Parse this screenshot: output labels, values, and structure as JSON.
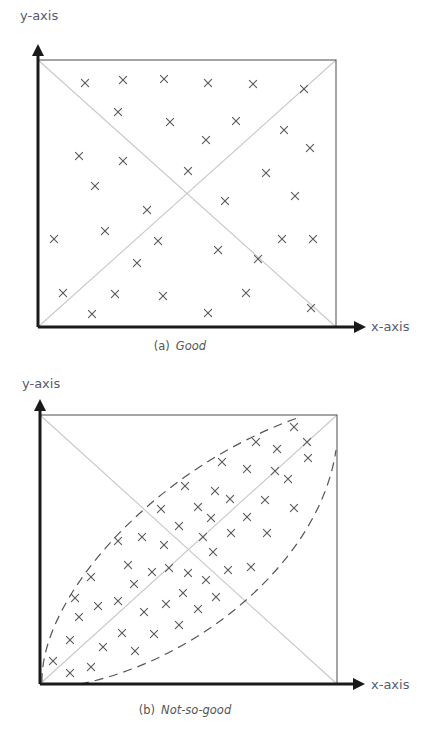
{
  "figures": [
    {
      "id": "a",
      "caption_prefix": "(a)",
      "caption_text": "Good",
      "x_axis_label": "x-axis",
      "y_axis_label": "y-axis",
      "frame": {
        "left": 38,
        "top": 60,
        "right": 336,
        "bottom": 327
      },
      "y_arrow_top": 44,
      "x_arrow_right": 366,
      "y_label_pos": [
        20,
        20
      ],
      "x_label_pos": [
        371,
        331
      ],
      "caption_pos": [
        180,
        350
      ],
      "diagonals": true,
      "ellipse": null,
      "marker": "x",
      "points": [
        [
          85,
          83
        ],
        [
          123,
          80
        ],
        [
          164,
          79
        ],
        [
          208,
          83
        ],
        [
          253,
          84
        ],
        [
          304,
          89
        ],
        [
          118,
          112
        ],
        [
          170,
          122
        ],
        [
          236,
          121
        ],
        [
          284,
          130
        ],
        [
          79,
          156
        ],
        [
          123,
          161
        ],
        [
          206,
          140
        ],
        [
          310,
          148
        ],
        [
          95,
          186
        ],
        [
          188,
          171
        ],
        [
          266,
          173
        ],
        [
          147,
          210
        ],
        [
          225,
          201
        ],
        [
          295,
          196
        ],
        [
          54,
          239
        ],
        [
          105,
          231
        ],
        [
          158,
          241
        ],
        [
          218,
          250
        ],
        [
          282,
          239
        ],
        [
          313,
          239
        ],
        [
          137,
          263
        ],
        [
          258,
          259
        ],
        [
          63,
          293
        ],
        [
          115,
          294
        ],
        [
          163,
          296
        ],
        [
          246,
          293
        ],
        [
          92,
          314
        ],
        [
          208,
          313
        ],
        [
          311,
          308
        ]
      ]
    },
    {
      "id": "b",
      "caption_prefix": "(b)",
      "caption_text": "Not-so-good",
      "x_axis_label": "x-axis",
      "y_axis_label": "y-axis",
      "frame": {
        "left": 40,
        "top": 415,
        "right": 337,
        "bottom": 684
      },
      "y_arrow_top": 399,
      "x_arrow_right": 365,
      "y_label_pos": [
        22,
        388
      ],
      "x_label_pos": [
        371,
        689
      ],
      "caption_pos": [
        185,
        714
      ],
      "diagonals": true,
      "ellipse": {
        "upper_path": "M 42 682 C 40 600, 150 470, 300 417",
        "lower_path": "M 80 684 C 200 660, 320 560, 336 450",
        "dash": "9 6"
      },
      "marker": "x",
      "points": [
        [
          294,
          427
        ],
        [
          256,
          442
        ],
        [
          307,
          442
        ],
        [
          277,
          449
        ],
        [
          308,
          458
        ],
        [
          222,
          462
        ],
        [
          247,
          469
        ],
        [
          275,
          471
        ],
        [
          288,
          479
        ],
        [
          185,
          486
        ],
        [
          215,
          491
        ],
        [
          230,
          499
        ],
        [
          265,
          500
        ],
        [
          161,
          509
        ],
        [
          198,
          507
        ],
        [
          294,
          508
        ],
        [
          211,
          518
        ],
        [
          247,
          517
        ],
        [
          179,
          526
        ],
        [
          203,
          537
        ],
        [
          231,
          533
        ],
        [
          267,
          533
        ],
        [
          118,
          541
        ],
        [
          142,
          537
        ],
        [
          164,
          545
        ],
        [
          213,
          552
        ],
        [
          128,
          565
        ],
        [
          152,
          572
        ],
        [
          169,
          568
        ],
        [
          188,
          573
        ],
        [
          228,
          570
        ],
        [
          251,
          567
        ],
        [
          91,
          577
        ],
        [
          206,
          580
        ],
        [
          134,
          584
        ],
        [
          183,
          593
        ],
        [
          216,
          597
        ],
        [
          75,
          598
        ],
        [
          98,
          606
        ],
        [
          118,
          601
        ],
        [
          166,
          604
        ],
        [
          144,
          612
        ],
        [
          198,
          609
        ],
        [
          79,
          617
        ],
        [
          179,
          625
        ],
        [
          122,
          633
        ],
        [
          154,
          634
        ],
        [
          70,
          640
        ],
        [
          103,
          647
        ],
        [
          135,
          651
        ],
        [
          53,
          661
        ],
        [
          91,
          667
        ],
        [
          70,
          673
        ]
      ]
    }
  ],
  "colors": {
    "axis": "#1a1a1a",
    "frame": "#6a6a6a",
    "diagonal": "#c8c8c8",
    "ellipse": "#555555",
    "marker": "#5a5a5a",
    "label": "#5a5a6e"
  }
}
